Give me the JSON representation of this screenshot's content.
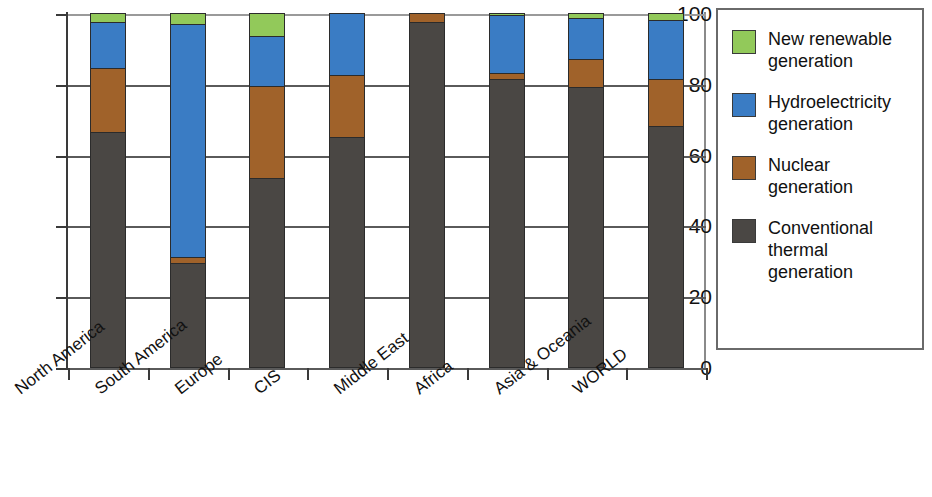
{
  "chart_data": {
    "type": "bar",
    "subtype": "stacked-bar-100-percent",
    "title": "",
    "xlabel": "",
    "ylabel": "",
    "ylim": [
      0,
      100
    ],
    "yticks": [
      0,
      20,
      40,
      60,
      80,
      100
    ],
    "ytick_labels": [
      "0",
      "20",
      "40",
      "60",
      "80",
      "100"
    ],
    "grid": true,
    "legend_position": "right",
    "categories": [
      "North America",
      "South America",
      "Europe",
      "CIS",
      "Middle East",
      "Africa",
      "Asia & Oceania",
      "WORLD"
    ],
    "series": [
      {
        "name": "Conventional thermal generation",
        "color": "#4a4744",
        "values": [
          66.5,
          29.5,
          53.5,
          65.0,
          97.5,
          81.5,
          79.0,
          68.0
        ]
      },
      {
        "name": "Nuclear generation",
        "color": "#a0622a",
        "values": [
          18.0,
          1.5,
          26.0,
          17.5,
          2.5,
          1.5,
          8.0,
          13.5
        ]
      },
      {
        "name": "Hydroelectricity generation",
        "color": "#3a7cc4",
        "values": [
          13.0,
          66.0,
          14.0,
          17.5,
          0.0,
          16.5,
          11.5,
          16.5
        ]
      },
      {
        "name": "New renewable generation",
        "color": "#92c95a",
        "values": [
          2.5,
          3.0,
          6.5,
          0.0,
          0.0,
          0.5,
          1.5,
          2.0
        ]
      }
    ]
  },
  "legend": {
    "items": [
      {
        "label_line1": "New renewable",
        "label_line2": "generation",
        "color": "#92c95a"
      },
      {
        "label_line1": "Hydroelectricity",
        "label_line2": "generation",
        "color": "#3a7cc4"
      },
      {
        "label_line1": "Nuclear",
        "label_line2": "generation",
        "color": "#a0622a"
      },
      {
        "label_line1": "Conventional",
        "label_line2": "thermal generation",
        "color": "#4a4744"
      }
    ]
  }
}
